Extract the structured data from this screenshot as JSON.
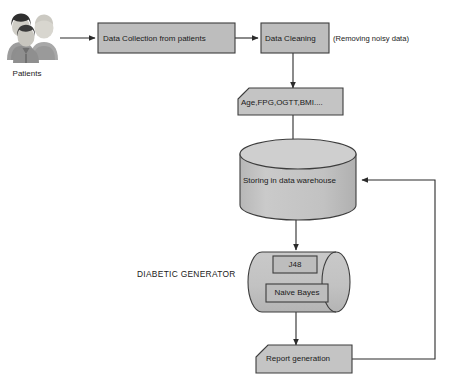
{
  "diagram": {
    "colors": {
      "node_fill": "#bdbdbd",
      "node_fill_light": "#c9c9c9",
      "cylinder_fill": "#c4c4c4",
      "cylinder_top": "#cfcfcf",
      "stroke": "#3d3d3d",
      "connector": "#2b2b2b",
      "text": "#1a1a1a",
      "background": "#ffffff"
    },
    "nodes": [
      {
        "id": "patients",
        "type": "actor-group-icon",
        "label": "Patients",
        "icon": "people-group-icon"
      },
      {
        "id": "data-collection",
        "type": "process-box",
        "label": "Data Collection from patients"
      },
      {
        "id": "data-cleaning",
        "type": "process-box",
        "label": "Data Cleaning"
      },
      {
        "id": "data-cleaning-note",
        "type": "annotation",
        "label": "(Removing noisy data)"
      },
      {
        "id": "attributes",
        "type": "document-box",
        "label": "Age,FPG,OGTT,BMI...."
      },
      {
        "id": "data-warehouse",
        "type": "cylinder-vertical",
        "label": "Storing in data warehouse"
      },
      {
        "id": "diabetic-generator",
        "type": "section-label",
        "label": "DIABETIC GENERATOR"
      },
      {
        "id": "generator-cylinder",
        "type": "cylinder-horizontal",
        "label": ""
      },
      {
        "id": "j48",
        "type": "process-box",
        "label": "J48"
      },
      {
        "id": "naive-bayes",
        "type": "process-box",
        "label": "Naive Bayes"
      },
      {
        "id": "report-generation",
        "type": "document-box",
        "label": "Report generation"
      }
    ],
    "edges": [
      {
        "from": "patients",
        "to": "data-collection",
        "style": "arrow"
      },
      {
        "from": "data-collection",
        "to": "data-cleaning",
        "style": "arrow"
      },
      {
        "from": "data-cleaning",
        "to": "attributes",
        "style": "arrow"
      },
      {
        "from": "attributes",
        "to": "data-warehouse",
        "style": "arrow"
      },
      {
        "from": "data-warehouse",
        "to": "generator-cylinder",
        "style": "arrow"
      },
      {
        "from": "generator-cylinder",
        "to": "report-generation",
        "style": "arrow"
      },
      {
        "from": "report-generation",
        "to": "data-warehouse",
        "style": "arrow-feedback"
      }
    ]
  }
}
